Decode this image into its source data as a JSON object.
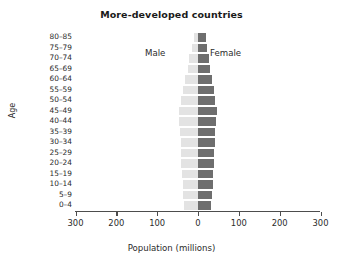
{
  "chart_data": {
    "type": "bar",
    "subtype": "population-pyramid",
    "title": "More-developed countries",
    "xlabel": "Population (millions)",
    "ylabel": "Age",
    "xlim": [
      -300,
      300
    ],
    "xticks": [
      -300,
      -200,
      -100,
      0,
      100,
      200,
      300
    ],
    "xtick_labels": [
      "300",
      "200",
      "100",
      "0",
      "100",
      "200",
      "300"
    ],
    "grid": false,
    "legend_position": "inside-top",
    "orientation": "horizontal",
    "categories": [
      "0–4",
      "5–9",
      "10–14",
      "15–19",
      "20–24",
      "25–29",
      "30–34",
      "35–39",
      "40–44",
      "45–49",
      "50–54",
      "55–59",
      "60–64",
      "65–69",
      "70–74",
      "75–79",
      "80–85"
    ],
    "series": [
      {
        "name": "Male",
        "side": "left",
        "color": "#e3e3e3",
        "values": [
          37,
          38,
          40,
          42,
          43,
          43,
          44,
          47,
          48,
          48,
          44,
          40,
          34,
          27,
          24,
          18,
          12
        ]
      },
      {
        "name": "Female",
        "side": "right",
        "color": "#6e6e6e",
        "values": [
          35,
          36,
          38,
          40,
          41,
          41,
          43,
          45,
          47,
          48,
          45,
          42,
          37,
          31,
          29,
          25,
          21
        ]
      }
    ],
    "annotations": [
      {
        "text": "Male",
        "x": -60,
        "y": "75–79"
      },
      {
        "text": "Female",
        "x": 35,
        "y": "75–79"
      }
    ]
  },
  "axes": {
    "y_title": "Age",
    "x_title": "Population (millions)"
  },
  "colors": {
    "male_bar": "#e3e3e3",
    "female_bar": "#6e6e6e",
    "axis": "#4d4d4d",
    "text": "#2b2b2b",
    "background": "#ffffff"
  }
}
